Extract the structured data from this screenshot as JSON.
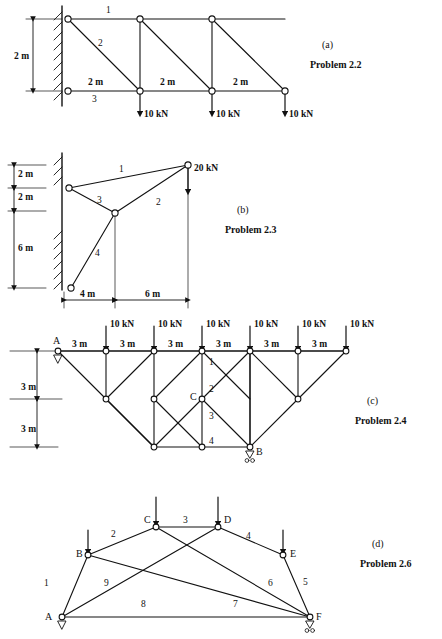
{
  "page": {
    "background": "#ffffff",
    "ink": "#111111",
    "width": 442,
    "height": 639
  },
  "figures": [
    {
      "id": "fig-a",
      "caption_tag": "(a)",
      "caption_title": "Problem 2.2",
      "caption_pos": [
        322,
        44
      ],
      "support_type": "wall-fixed",
      "vertical_dims": [
        "2 m"
      ],
      "span_dims": [
        "2 m",
        "2 m",
        "2 m"
      ],
      "member_numbers": [
        "1",
        "2",
        "3"
      ],
      "loads": [
        "10 kN",
        "10 kN",
        "10 kN"
      ]
    },
    {
      "id": "fig-b",
      "caption_tag": "(b)",
      "caption_title": "Problem 2.3",
      "caption_pos": [
        237,
        208
      ],
      "support_type": "wall-fixed",
      "vertical_dims": [
        "2 m",
        "2 m",
        "6 m"
      ],
      "span_dims": [
        "4 m",
        "6 m"
      ],
      "member_numbers": [
        "1",
        "2",
        "3",
        "4"
      ],
      "loads": [
        "20 kN"
      ]
    },
    {
      "id": "fig-c",
      "caption_tag": "(c)",
      "caption_title": "Problem 2.4",
      "caption_pos": [
        367,
        400
      ],
      "vertical_dims": [
        "3 m",
        "3 m"
      ],
      "span_dims": [
        "3 m",
        "3 m",
        "3 m",
        "3 m",
        "3 m",
        "3 m"
      ],
      "member_numbers": [
        "1",
        "2",
        "3",
        "4"
      ],
      "node_labels": [
        "A",
        "B",
        "C"
      ],
      "loads": [
        "10 kN",
        "10 kN",
        "10 kN",
        "10 kN",
        "10 kN",
        "10 kN"
      ]
    },
    {
      "id": "fig-d",
      "caption_tag": "(d)",
      "caption_title": "Problem 2.6",
      "caption_pos": [
        372,
        543
      ],
      "member_numbers": [
        "1",
        "2",
        "3",
        "4",
        "5",
        "6",
        "7",
        "8",
        "9"
      ],
      "node_labels": [
        "A",
        "B",
        "C",
        "D",
        "E",
        "F"
      ]
    }
  ],
  "fig_a": {
    "dims": [
      {
        "text": "2 m",
        "x": 14,
        "y": 52
      },
      {
        "text": "2 m",
        "x": 88,
        "y": 82
      },
      {
        "text": "2 m",
        "x": 160,
        "y": 82
      },
      {
        "text": "2 m",
        "x": 233,
        "y": 82
      }
    ],
    "members": [
      {
        "text": "1",
        "x": 106,
        "y": 8
      },
      {
        "text": "2",
        "x": 98,
        "y": 41
      },
      {
        "text": "3",
        "x": 92,
        "y": 98
      }
    ],
    "loads": [
      {
        "text": "10 kN",
        "x": 140,
        "y": 112
      },
      {
        "text": "10 kN",
        "x": 212,
        "y": 112
      },
      {
        "text": "10 kN",
        "x": 285,
        "y": 112
      }
    ]
  },
  "fig_b": {
    "dims": [
      {
        "text": "2 m",
        "x": 18,
        "y": 174
      },
      {
        "text": "2 m",
        "x": 18,
        "y": 196
      },
      {
        "text": "6 m",
        "x": 18,
        "y": 250
      },
      {
        "text": "4 m",
        "x": 80,
        "y": 291
      },
      {
        "text": "6 m",
        "x": 145,
        "y": 291
      }
    ],
    "members": [
      {
        "text": "1",
        "x": 119,
        "y": 169
      },
      {
        "text": "2",
        "x": 156,
        "y": 202
      },
      {
        "text": "3",
        "x": 97,
        "y": 200
      },
      {
        "text": "4",
        "x": 95,
        "y": 253
      }
    ],
    "loads": [
      {
        "text": "20 kN",
        "x": 198,
        "y": 169
      }
    ]
  },
  "fig_c": {
    "dims": [
      {
        "text": "3 m",
        "x": 21,
        "y": 386
      },
      {
        "text": "3 m",
        "x": 21,
        "y": 428
      },
      {
        "text": "3 m",
        "x": 79,
        "y": 344
      },
      {
        "text": "3 m",
        "x": 127,
        "y": 344
      },
      {
        "text": "3 m",
        "x": 175,
        "y": 344
      },
      {
        "text": "3 m",
        "x": 223,
        "y": 344
      },
      {
        "text": "3 m",
        "x": 271,
        "y": 344
      },
      {
        "text": "3 m",
        "x": 319,
        "y": 344
      }
    ],
    "members": [
      {
        "text": "1",
        "x": 230,
        "y": 363
      },
      {
        "text": "2",
        "x": 230,
        "y": 388
      },
      {
        "text": "3",
        "x": 230,
        "y": 415
      },
      {
        "text": "4",
        "x": 230,
        "y": 440
      }
    ],
    "nodes": [
      {
        "text": "A",
        "x": 56,
        "y": 340
      },
      {
        "text": "B",
        "x": 268,
        "y": 449
      },
      {
        "text": "C",
        "x": 196,
        "y": 393
      }
    ],
    "loads": [
      {
        "text": "10 kN",
        "x": 110,
        "y": 325
      },
      {
        "text": "10 kN",
        "x": 158,
        "y": 325
      },
      {
        "text": "10 kN",
        "x": 206,
        "y": 325
      },
      {
        "text": "10 kN",
        "x": 254,
        "y": 325
      },
      {
        "text": "10 kN",
        "x": 302,
        "y": 325
      },
      {
        "text": "10 kN",
        "x": 350,
        "y": 325
      }
    ]
  },
  "fig_d": {
    "members": [
      {
        "text": "1",
        "x": 44,
        "y": 583
      },
      {
        "text": "2",
        "x": 111,
        "y": 534
      },
      {
        "text": "3",
        "x": 183,
        "y": 521
      },
      {
        "text": "4",
        "x": 246,
        "y": 536
      },
      {
        "text": "5",
        "x": 303,
        "y": 582
      },
      {
        "text": "6",
        "x": 268,
        "y": 583
      },
      {
        "text": "7",
        "x": 233,
        "y": 604
      },
      {
        "text": "8",
        "x": 141,
        "y": 604
      },
      {
        "text": "9",
        "x": 104,
        "y": 583
      }
    ],
    "nodes": [
      {
        "text": "A",
        "x": 48,
        "y": 620
      },
      {
        "text": "B",
        "x": 80,
        "y": 548
      },
      {
        "text": "C",
        "x": 143,
        "y": 519
      },
      {
        "text": "D",
        "x": 224,
        "y": 519
      },
      {
        "text": "E",
        "x": 289,
        "y": 548
      },
      {
        "text": "F",
        "x": 316,
        "y": 620
      }
    ]
  }
}
